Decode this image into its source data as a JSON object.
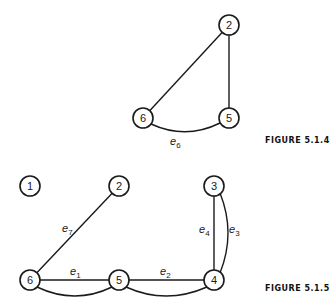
{
  "figures": [
    {
      "caption": "FIGURE 5.1.4",
      "nodes": [
        {
          "id": "2",
          "x": 229,
          "y": 25
        },
        {
          "id": "5",
          "x": 229,
          "y": 118
        },
        {
          "id": "6",
          "x": 143,
          "y": 118
        }
      ],
      "edges": [
        {
          "from": "6",
          "to": "2",
          "label": ""
        },
        {
          "from": "2",
          "to": "5",
          "label": ""
        },
        {
          "from": "6",
          "to": "5",
          "label": "e",
          "sub": "6",
          "curved": true
        }
      ]
    },
    {
      "caption": "FIGURE 5.1.5",
      "nodes": [
        {
          "id": "1",
          "x": 30,
          "y": 186
        },
        {
          "id": "2",
          "x": 119,
          "y": 186
        },
        {
          "id": "3",
          "x": 214,
          "y": 186
        },
        {
          "id": "6",
          "x": 30,
          "y": 280
        },
        {
          "id": "5",
          "x": 119,
          "y": 280
        },
        {
          "id": "4",
          "x": 214,
          "y": 280
        }
      ],
      "edges": [
        {
          "from": "6",
          "to": "2",
          "label": "e",
          "sub": "7"
        },
        {
          "from": "6",
          "to": "5",
          "label": "e",
          "sub": "1"
        },
        {
          "from": "6",
          "to": "5",
          "label": "",
          "curved": true
        },
        {
          "from": "5",
          "to": "4",
          "label": "e",
          "sub": "2"
        },
        {
          "from": "5",
          "to": "4",
          "label": "",
          "curved": true
        },
        {
          "from": "3",
          "to": "4",
          "label": "e",
          "sub": "4"
        },
        {
          "from": "3",
          "to": "4",
          "label": "e",
          "sub": "3",
          "curved": true
        }
      ]
    }
  ],
  "text": {
    "fig1_caption": "FIGURE 5.1.4",
    "fig2_caption": "FIGURE 5.1.5",
    "n2a": "2",
    "n5a": "5",
    "n6a": "6",
    "n1b": "1",
    "n2b": "2",
    "n3b": "3",
    "n4b": "4",
    "n5b": "5",
    "n6b": "6",
    "e": "e",
    "s6": "6",
    "s7": "7",
    "s1": "1",
    "s2": "2",
    "s3": "3",
    "s4": "4"
  }
}
